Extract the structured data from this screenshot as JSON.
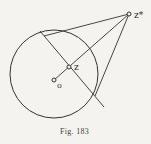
{
  "figure": {
    "caption": "Fig. 183",
    "labels": {
      "z_star": "z*",
      "z": "z",
      "origin": "o"
    },
    "colors": {
      "ink": "#333333",
      "paper": "#f4f3f0"
    }
  }
}
